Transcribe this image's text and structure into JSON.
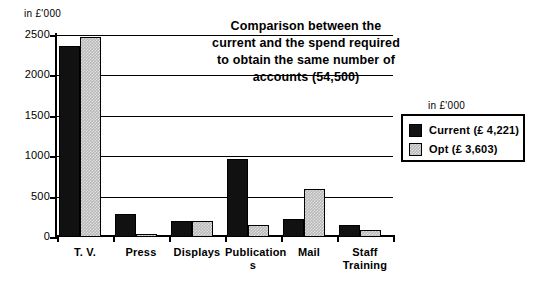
{
  "axis_unit_caption": "in £'000",
  "legend": {
    "unit_caption": "in £'000",
    "entries": [
      {
        "label": "Current  (£  4,221)",
        "key": "current",
        "color": "#111111"
      },
      {
        "label": "Opt  (£  3,603)",
        "key": "opt",
        "color": "#b8b8b8"
      }
    ]
  },
  "title_lines": [
    "Comparison  between  the",
    "current  and  the  spend  required",
    "to  obtain  the  same  number  of",
    "accounts   (54,500)"
  ],
  "chart_data": {
    "type": "bar",
    "xlabel": "",
    "ylabel": "in £'000",
    "ylim": [
      0,
      2500
    ],
    "yticks": [
      0,
      500,
      1000,
      1500,
      2000,
      2500
    ],
    "ytick_labels": [
      "0",
      "500",
      "1000",
      "1500",
      "2000",
      "2500"
    ],
    "grid": true,
    "legend_position": "right",
    "categories": [
      "T. V.",
      "Press",
      "Displays",
      "Publications",
      "Mail",
      "Staff Training"
    ],
    "category_label_lines": [
      [
        "T. V."
      ],
      [
        "Press"
      ],
      [
        "Displays"
      ],
      [
        "Publication",
        "s"
      ],
      [
        "Mail"
      ],
      [
        "Staff",
        "Training"
      ]
    ],
    "series": [
      {
        "name": "Current (£ 4,221)",
        "total": 4221,
        "color": "#111111",
        "values": [
          2360,
          285,
          200,
          960,
          225,
          150
        ]
      },
      {
        "name": "Opt (£ 3,603)",
        "total": 3603,
        "color": "#b8b8b8",
        "values": [
          2475,
          40,
          200,
          150,
          595,
          90
        ]
      }
    ]
  }
}
